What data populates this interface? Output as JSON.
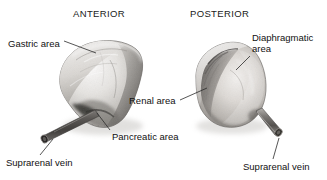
{
  "figure": {
    "kind": "anatomical-illustration",
    "background_color": "#ffffff",
    "text_color": "#111111"
  },
  "views": [
    {
      "id": "anterior",
      "title": "ANTERIOR",
      "title_x": 73,
      "title_y": 8
    },
    {
      "id": "posterior",
      "title": "POSTERIOR",
      "title_x": 190,
      "title_y": 8
    }
  ],
  "labels": [
    {
      "id": "gastric-area",
      "text": "Gastric area",
      "x": 8,
      "y": 38,
      "two_line": false
    },
    {
      "id": "diaphragmatic-area",
      "text": "Diaphragmatic area",
      "x": 252,
      "y": 32,
      "two_line": true
    },
    {
      "id": "renal-area",
      "text": "Renal area",
      "x": 129,
      "y": 95,
      "two_line": false
    },
    {
      "id": "pancreatic-area",
      "text": "Pancreatic area",
      "x": 112,
      "y": 131,
      "two_line": false
    },
    {
      "id": "suprarenal-vein-left",
      "text": "Suprarenal vein",
      "x": 6,
      "y": 157,
      "two_line": false
    },
    {
      "id": "suprarenal-vein-right",
      "text": "Suprarenal vein",
      "x": 243,
      "y": 161,
      "two_line": false
    }
  ],
  "specimens": [
    {
      "id": "anterior-gland",
      "view": "anterior",
      "description": "suprarenal gland anterior surface"
    },
    {
      "id": "posterior-gland",
      "view": "posterior",
      "description": "suprarenal gland posterior surface"
    }
  ],
  "vessels": [
    {
      "id": "suprarenal-vein-anterior",
      "view": "anterior"
    },
    {
      "id": "suprarenal-vein-posterior",
      "view": "posterior"
    }
  ],
  "colors": {
    "tissue_light": "#e9e7e4",
    "tissue_mid": "#bdbab6",
    "tissue_dark": "#6f6c69",
    "tissue_shadow": "#3d3b39",
    "vein_dark": "#4a4846",
    "leader_line": "#2b2b2b"
  }
}
